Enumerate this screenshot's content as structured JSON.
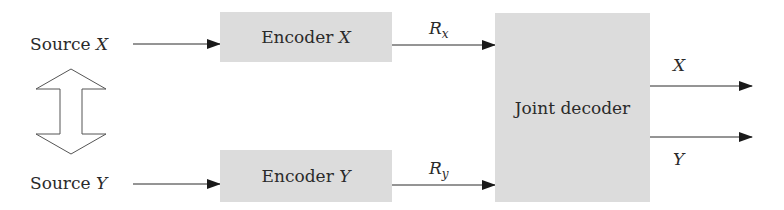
{
  "diagram": {
    "type": "block-diagram",
    "sources": [
      {
        "label_prefix": "Source ",
        "label_var": "X"
      },
      {
        "label_prefix": "Source ",
        "label_var": "Y"
      }
    ],
    "correlation_arrow": "bidirectional-hollow-arrow",
    "encoders": [
      {
        "label_prefix": "Encoder ",
        "label_var": "X",
        "rate_main": "R",
        "rate_sub": "x"
      },
      {
        "label_prefix": "Encoder ",
        "label_var": "Y",
        "rate_main": "R",
        "rate_sub": "y"
      }
    ],
    "decoder": {
      "label": "Joint decoder"
    },
    "outputs": [
      {
        "label": "X"
      },
      {
        "label": "Y"
      }
    ],
    "colors": {
      "box_fill": "#dcdcdc",
      "line": "#2a2a2a",
      "background": "#ffffff"
    }
  }
}
